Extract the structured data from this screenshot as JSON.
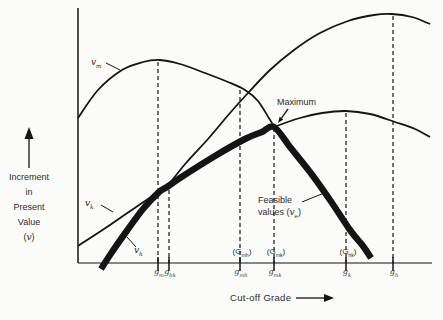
{
  "canvas": {
    "w": 443,
    "h": 320,
    "bg": "#fbfbf9",
    "ink": "#141414",
    "text": "#2b2b2b"
  },
  "ylabel": {
    "lines": [
      "Increment",
      "in",
      "Present",
      "Value"
    ],
    "symbol_pre": "(",
    "symbol": "v",
    "symbol_post": ")"
  },
  "xlabel": {
    "text": "Cut-off Grade"
  },
  "maximum_label": "Maximum",
  "feasible_label": {
    "line1": "Feasible",
    "line2_pre": "values (",
    "line2_sym": "v",
    "line2_sub": "e",
    "line2_post": ")",
    "leader": [
      [
        302,
        202
      ],
      [
        324,
        193
      ]
    ]
  },
  "arrows": {
    "y_axis_annotation": {
      "from": [
        29,
        168
      ],
      "to": [
        29,
        127
      ],
      "head_len": 12,
      "head_w": 9
    },
    "x_axis_annotation": {
      "from": [
        296,
        298
      ],
      "to": [
        334,
        298
      ],
      "head_len": 10,
      "head_w": 8
    },
    "maximum": {
      "from": [
        288,
        109
      ],
      "to": [
        278,
        123
      ],
      "head_len": 6,
      "head_w": 4.5
    }
  },
  "chart_data": {
    "type": "line",
    "title": "",
    "xlabel": "Cut-off Grade",
    "ylabel": "Increment in Present Value (v)",
    "numeric_axes": false,
    "note": "Conceptual diagram (Lane cut-off grade optimization); coordinates are pixel positions on the 443x320 screenshot, y increases downward.",
    "plot": {
      "y_axis_x": 78,
      "x_axis_y": 263,
      "x_end": 432,
      "y_top": 8
    },
    "x_tick_labels": [
      "g_m",
      "g_hk",
      "g_mh",
      "g_mk",
      "g_k",
      "g_h"
    ],
    "upper_axis_labels": [
      "(G_mh)",
      "(G_mk)",
      "(G_hk)"
    ],
    "maximum_point": [
      277,
      124
    ],
    "curves": [
      {
        "id": "vm",
        "label_pre": "v",
        "label_sub": "m",
        "width": 1.8,
        "label_left": 91,
        "label_top": 57,
        "leader": [
          [
            106,
            63
          ],
          [
            120,
            70
          ]
        ],
        "points": [
          [
            78,
            118
          ],
          [
            98,
            90
          ],
          [
            122,
            70
          ],
          [
            143,
            62
          ],
          [
            160,
            60
          ],
          [
            180,
            64
          ],
          [
            205,
            73
          ],
          [
            228,
            82
          ],
          [
            245,
            90
          ],
          [
            258,
            101
          ],
          [
            274,
            126
          ],
          [
            292,
            150
          ],
          [
            312,
            176
          ],
          [
            332,
            203
          ],
          [
            352,
            232
          ],
          [
            364,
            247
          ],
          [
            371,
            258
          ]
        ]
      },
      {
        "id": "vh",
        "label_pre": "v",
        "label_sub": "h",
        "width": 1.8,
        "label_left": 134,
        "label_top": 245,
        "leader": [
          [
            136,
            247
          ],
          [
            127,
            237
          ]
        ],
        "points": [
          [
            166,
            188
          ],
          [
            186,
            163
          ],
          [
            208,
            139
          ],
          [
            230,
            113
          ],
          [
            248,
            93
          ],
          [
            270,
            70
          ],
          [
            294,
            50
          ],
          [
            320,
            33
          ],
          [
            348,
            21
          ],
          [
            374,
            15
          ],
          [
            392,
            14
          ],
          [
            412,
            17
          ],
          [
            430,
            24
          ]
        ]
      },
      {
        "id": "vk",
        "label_pre": "v",
        "label_sub": "k",
        "width": 1.8,
        "label_left": 85,
        "label_top": 198,
        "leader": [
          [
            101,
            205
          ],
          [
            113,
            212
          ]
        ],
        "points": [
          [
            78,
            246
          ],
          [
            110,
            225
          ],
          [
            145,
            201
          ],
          [
            180,
            178
          ],
          [
            215,
            156
          ],
          [
            245,
            139
          ],
          [
            274,
            127
          ],
          [
            300,
            118
          ],
          [
            322,
            113
          ],
          [
            346,
            111
          ],
          [
            370,
            114
          ],
          [
            395,
            122
          ],
          [
            415,
            129
          ],
          [
            430,
            137
          ]
        ]
      },
      {
        "id": "ve_feasible",
        "width": 6.5,
        "points": [
          [
            101,
            269
          ],
          [
            112,
            252
          ],
          [
            126,
            232
          ],
          [
            143,
            209
          ],
          [
            158,
            193
          ],
          [
            167,
            187
          ],
          [
            180,
            178
          ],
          [
            215,
            156
          ],
          [
            245,
            139
          ],
          [
            262,
            132
          ],
          [
            274,
            127
          ],
          [
            290,
            147
          ],
          [
            310,
            172
          ],
          [
            330,
            200
          ],
          [
            350,
            230
          ],
          [
            363,
            246
          ],
          [
            371,
            258
          ]
        ]
      }
    ],
    "guides": [
      {
        "x": 158,
        "y_top": 62,
        "tick_pre": "g",
        "tick_sub": "m"
      },
      {
        "x": 169,
        "y_top": 190,
        "tick_pre": "g",
        "tick_sub": "hk"
      },
      {
        "x": 240,
        "y_top": 90,
        "tick_pre": "g",
        "tick_sub": "mh",
        "above_pre": "(G",
        "above_sub": "mh",
        "above_post": ")"
      },
      {
        "x": 274,
        "y_top": 128,
        "tick_pre": "g",
        "tick_sub": "mk",
        "above_pre": "(G",
        "above_sub": "mk",
        "above_post": ")"
      },
      {
        "x": 346,
        "y_top": 113,
        "tick_pre": "g",
        "tick_sub": "k",
        "above_pre": "(G",
        "above_sub": "hk",
        "above_post": ")"
      },
      {
        "x": 393,
        "y_top": 16,
        "tick_pre": "g",
        "tick_sub": "h"
      }
    ]
  }
}
